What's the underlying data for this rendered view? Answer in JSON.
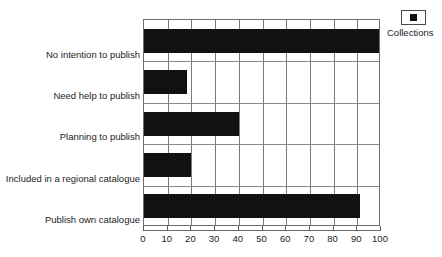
{
  "chart_data": {
    "type": "bar",
    "orientation": "horizontal",
    "title": "",
    "xlabel": "",
    "ylabel": "",
    "xlim": [
      0,
      100
    ],
    "xticks": [
      0,
      10,
      20,
      30,
      40,
      50,
      60,
      70,
      80,
      90,
      100
    ],
    "xtick_labels": [
      "0",
      "10",
      "20",
      "30",
      "40",
      "50",
      "60",
      "70",
      "80",
      "90",
      "100"
    ],
    "grid": "vertical-and-horizontal",
    "categories": [
      "No intention to publish",
      "Need help to publish",
      "Planning to publish",
      "Included in a regional catalogue",
      "Publish own catalogue"
    ],
    "values": [
      99,
      18,
      40,
      20,
      91
    ],
    "series": [
      {
        "name": "Collections",
        "color": "#111111",
        "values": [
          99,
          18,
          40,
          20,
          91
        ]
      }
    ],
    "legend": {
      "position": "top-right",
      "entries": [
        {
          "label": "Collections",
          "color": "#111111",
          "marker": "filled-square"
        }
      ]
    }
  },
  "legend": {
    "label": "Collections",
    "marker_name": "legend-square-marker"
  },
  "colors": {
    "bar": "#111111",
    "grid": "#7a7a7a",
    "axis": "#6e6e6e",
    "text": "#1c1c1c",
    "background": "#ffffff"
  }
}
